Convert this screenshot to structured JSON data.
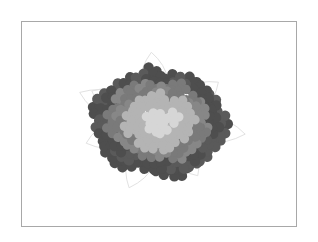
{
  "image": {
    "subject": "hydrangea flower cluster illustration",
    "style": "grayscale",
    "frame": {
      "x": 21,
      "y": 21,
      "width": 276,
      "height": 206,
      "border_color": "#a8a8a8"
    },
    "center": {
      "x": 159,
      "y": 122
    },
    "palette": {
      "outer": "#5a5a5a",
      "outer_alt": "#4e4e4e",
      "mid": "#878787",
      "mid_alt": "#7a7a7a",
      "light": "#b4b4b4",
      "center": "#d6d6d6",
      "leaf_outline": "#e2e2e2",
      "background": "#ffffff"
    }
  }
}
